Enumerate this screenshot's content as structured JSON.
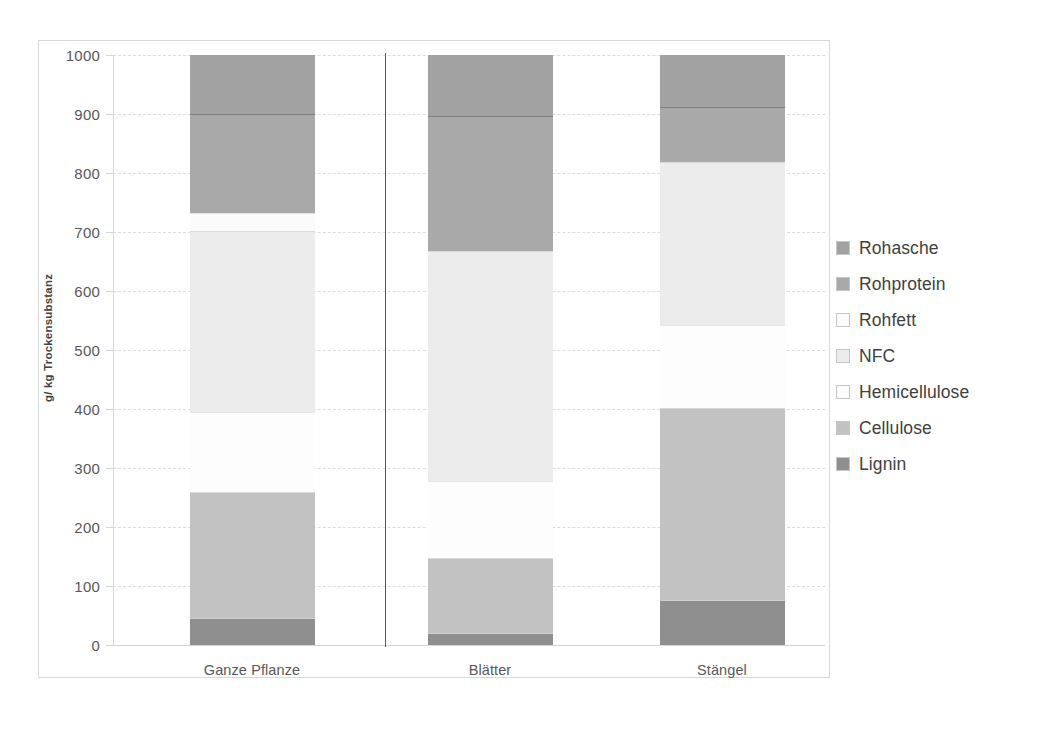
{
  "chart_data": {
    "type": "bar",
    "stacked": true,
    "title": "",
    "xlabel": "",
    "ylabel": "g/ kg Trockensubstanz",
    "ylim": [
      0,
      1000
    ],
    "ytick_labels": [
      "1000",
      "900",
      "800",
      "700",
      "600",
      "500",
      "400",
      "300",
      "200",
      "100",
      "0"
    ],
    "ytick_values": [
      1000,
      900,
      800,
      700,
      600,
      500,
      400,
      300,
      200,
      100,
      0
    ],
    "grid": true,
    "legend_position": "right",
    "categories": [
      "Ganze Pflanze",
      "Blätter",
      "Stängel"
    ],
    "stack_order_bottom_to_top": [
      "Lignin",
      "Cellulose",
      "Hemicellulose",
      "NFC",
      "Rohfett",
      "Rohprotein",
      "Rohasche"
    ],
    "series": [
      {
        "name": "Rohasche",
        "color": "#a2a2a2",
        "values": [
          100,
          103,
          88
        ]
      },
      {
        "name": "Rohprotein",
        "color": "#a9a9a9",
        "values": [
          167,
          230,
          94
        ]
      },
      {
        "name": "Rohfett",
        "color": "#fbfbfb",
        "values": [
          32,
          0,
          0
        ]
      },
      {
        "name": "NFC",
        "color": "#ececec",
        "values": [
          306,
          389,
          276
        ]
      },
      {
        "name": "Hemicellulose",
        "color": "#fdfdfd",
        "values": [
          135,
          131,
          140
        ]
      },
      {
        "name": "Cellulose",
        "color": "#c2c2c2",
        "values": [
          215,
          127,
          325
        ]
      },
      {
        "name": "Lignin",
        "color": "#8f8f8f",
        "values": [
          45,
          20,
          77
        ]
      }
    ],
    "cumulative_tops": {
      "Ganze Pflanze": {
        "Lignin": 45,
        "Cellulose": 260,
        "Hemicellulose": 395,
        "NFC": 701,
        "Rohfett": 733,
        "Rohprotein": 900,
        "Rohasche": 1000
      },
      "Blätter": {
        "Lignin": 20,
        "Cellulose": 147,
        "Hemicellulose": 278,
        "NFC": 667,
        "Rohfett": 667,
        "Rohprotein": 897,
        "Rohasche": 1000
      },
      "Stängel": {
        "Lignin": 77,
        "Cellulose": 402,
        "Hemicellulose": 542,
        "NFC": 818,
        "Rohfett": 818,
        "Rohprotein": 912,
        "Rohasche": 1000
      }
    }
  },
  "legend": {
    "items": [
      {
        "label": "Rohasche",
        "swatch": "#a2a2a2"
      },
      {
        "label": "Rohprotein",
        "swatch": "#a9a9a9"
      },
      {
        "label": "Rohfett",
        "swatch": "#fbfbfb"
      },
      {
        "label": "NFC",
        "swatch": "#ececec"
      },
      {
        "label": "Hemicellulose",
        "swatch": "#fdfdfd"
      },
      {
        "label": "Cellulose",
        "swatch": "#c2c2c2"
      },
      {
        "label": "Lignin",
        "swatch": "#8f8f8f"
      }
    ]
  }
}
